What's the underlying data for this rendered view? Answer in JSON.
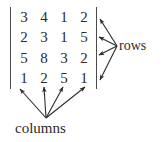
{
  "figure": {
    "type": "matrix-annotation-diagram",
    "width": 164,
    "height": 142,
    "background_color": "#ffffff",
    "ink_color": "#2b2b2b"
  },
  "matrix": {
    "delimiter": "vertical-bar",
    "rows_count": 4,
    "columns_count": 4,
    "values": [
      [
        "3",
        "4",
        "1",
        "2"
      ],
      [
        "2",
        "3",
        "1",
        "5"
      ],
      [
        "5",
        "8",
        "3",
        "2"
      ],
      [
        "1",
        "2",
        "5",
        "1"
      ]
    ]
  },
  "annotations": {
    "rows_label": "rows",
    "columns_label": "columns",
    "rows_arrow_count": 4,
    "columns_arrow_count": 4
  },
  "arrows": {
    "rows": [
      {
        "x1": 117,
        "y1": 46,
        "x2": 100,
        "y2": 19
      },
      {
        "x1": 117,
        "y1": 46,
        "x2": 99,
        "y2": 37
      },
      {
        "x1": 117,
        "y1": 46,
        "x2": 99,
        "y2": 55
      },
      {
        "x1": 117,
        "y1": 46,
        "x2": 100,
        "y2": 80
      }
    ],
    "columns": [
      {
        "x1": 46,
        "y1": 118,
        "x2": 20,
        "y2": 89
      },
      {
        "x1": 46,
        "y1": 118,
        "x2": 44,
        "y2": 87
      },
      {
        "x1": 46,
        "y1": 118,
        "x2": 63,
        "y2": 87
      },
      {
        "x1": 46,
        "y1": 118,
        "x2": 85,
        "y2": 87
      }
    ]
  }
}
